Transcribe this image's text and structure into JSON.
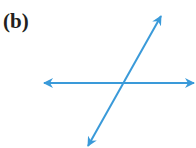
{
  "figure": {
    "label": "(b)",
    "line_color": "#3a9ad9"
  },
  "lines": [
    {
      "name": "horizontal-line",
      "x1": 44,
      "y1": 83,
      "x2": 194,
      "y2": 83
    },
    {
      "name": "diagonal-line",
      "x1": 161,
      "y1": 16,
      "x2": 88,
      "y2": 146
    }
  ]
}
